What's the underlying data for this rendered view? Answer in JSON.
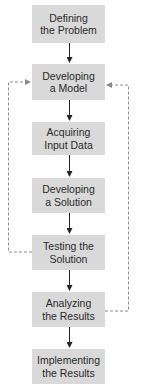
{
  "diagram": {
    "type": "flowchart",
    "steps": [
      {
        "line1": "Defining",
        "line2": "the Problem"
      },
      {
        "line1": "Developing",
        "line2": "a Model"
      },
      {
        "line1": "Acquiring",
        "line2": "Input Data"
      },
      {
        "line1": "Developing",
        "line2": "a Solution"
      },
      {
        "line1": "Testing the",
        "line2": "Solution"
      },
      {
        "line1": "Analyzing",
        "line2": "the Results"
      },
      {
        "line1": "Implementing",
        "line2": "the Results"
      }
    ],
    "feedback_loops": [
      {
        "from": "Testing the Solution",
        "to": "Developing a Model",
        "side": "left",
        "style": "dashed"
      },
      {
        "from": "Analyzing the Results",
        "to": "Developing a Model",
        "side": "right",
        "style": "dashed"
      }
    ],
    "colors": {
      "box": "#d9d9d9",
      "text": "#2a2a2a",
      "arrow": "#222222",
      "dashed": "#8a8a8a"
    }
  }
}
